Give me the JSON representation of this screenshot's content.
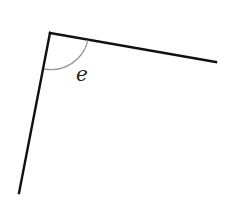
{
  "diagram": {
    "type": "angle",
    "vertex": [
      50,
      33
    ],
    "ray_right_end": [
      216,
      62
    ],
    "ray_down_end": [
      19,
      193
    ],
    "angle_label": "e",
    "line_color": "#111111",
    "arc_color": "#999999"
  }
}
